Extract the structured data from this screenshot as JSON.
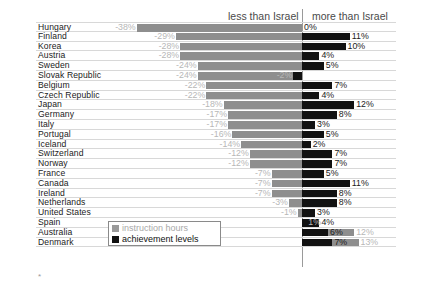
{
  "header": {
    "left_label": "less than Israel",
    "right_label": "more than Israel"
  },
  "legend": {
    "items": [
      {
        "label": "instruction hours",
        "color": "#9a9a9a",
        "swatch": "gray-square-icon"
      },
      {
        "label": "achievement levels",
        "color": "#111111",
        "swatch": "black-square-icon"
      }
    ]
  },
  "footnote": "*",
  "colors": {
    "instruction_hours": "#8e8e8e",
    "achievement_levels": "#121212",
    "negative_label": "#b7b7b7",
    "positive_label": "#1b1b1b",
    "gridline": "#d8d8d8",
    "axis": "#9a9a9a"
  },
  "chart_data": {
    "type": "bar",
    "title": "",
    "subtitle": "",
    "xlabel": "",
    "ylabel": "",
    "orientation": "horizontal",
    "grid": true,
    "legend_position": "bottom-left",
    "axis_labels": {
      "negative_side": "less than Israel",
      "positive_side": "more than Israel"
    },
    "zero_reference": "Israel",
    "xlim": [
      -40,
      16
    ],
    "categories": [
      "Hungary",
      "Finland",
      "Korea",
      "Austria",
      "Sweden",
      "Slovak Republic",
      "Belgium",
      "Czech Republic",
      "Japan",
      "Germany",
      "Italy",
      "Portugal",
      "Iceland",
      "Switzerland",
      "Norway",
      "France",
      "Canada",
      "Ireland",
      "Netherlands",
      "United States",
      "Spain",
      "Australia",
      "Denmark"
    ],
    "series": [
      {
        "name": "instruction hours",
        "color": "#8e8e8e",
        "values": [
          -38,
          -29,
          -28,
          -28,
          -24,
          -24,
          -22,
          -22,
          -18,
          -17,
          -17,
          -16,
          -14,
          -12,
          -12,
          -7,
          -7,
          -7,
          -3,
          -1,
          1,
          12,
          13
        ],
        "labels": [
          "-38%",
          "-29%",
          "-28%",
          "-28%",
          "-24%",
          "-24%",
          "-22%",
          "-22%",
          "-18%",
          "-17%",
          "-17%",
          "-16%",
          "-14%",
          "-12%",
          "-12%",
          "-7%",
          "-7%",
          "-7%",
          "-3%",
          "-1%",
          "1%",
          "12%",
          "13%"
        ]
      },
      {
        "name": "achievement levels",
        "color": "#121212",
        "values": [
          0,
          11,
          10,
          4,
          5,
          -2,
          7,
          4,
          12,
          8,
          3,
          5,
          2,
          7,
          7,
          5,
          11,
          8,
          8,
          3,
          4,
          6,
          7
        ],
        "labels": [
          "0%",
          "11%",
          "10%",
          "4%",
          "5%",
          "-2%",
          "7%",
          "4%",
          "12%",
          "8%",
          "3%",
          "5%",
          "2%",
          "7%",
          "7%",
          "5%",
          "11%",
          "8%",
          "8%",
          "3%",
          "4%",
          "6%",
          "7%"
        ]
      }
    ],
    "rows": [
      {
        "country": "Hungary",
        "hours": -38,
        "hours_label": "-38%",
        "achv": 0,
        "achv_label": "0%"
      },
      {
        "country": "Finland",
        "hours": -29,
        "hours_label": "-29%",
        "achv": 11,
        "achv_label": "11%"
      },
      {
        "country": "Korea",
        "hours": -28,
        "hours_label": "-28%",
        "achv": 10,
        "achv_label": "10%"
      },
      {
        "country": "Austria",
        "hours": -28,
        "hours_label": "-28%",
        "achv": 4,
        "achv_label": "4%"
      },
      {
        "country": "Sweden",
        "hours": -24,
        "hours_label": "-24%",
        "achv": 5,
        "achv_label": "5%"
      },
      {
        "country": "Slovak Republic",
        "hours": -24,
        "hours_label": "-24%",
        "achv": -2,
        "achv_label": "-2%"
      },
      {
        "country": "Belgium",
        "hours": -22,
        "hours_label": "-22%",
        "achv": 7,
        "achv_label": "7%"
      },
      {
        "country": "Czech Republic",
        "hours": -22,
        "hours_label": "-22%",
        "achv": 4,
        "achv_label": "4%"
      },
      {
        "country": "Japan",
        "hours": -18,
        "hours_label": "-18%",
        "achv": 12,
        "achv_label": "12%"
      },
      {
        "country": "Germany",
        "hours": -17,
        "hours_label": "-17%",
        "achv": 8,
        "achv_label": "8%"
      },
      {
        "country": "Italy",
        "hours": -17,
        "hours_label": "-17%",
        "achv": 3,
        "achv_label": "3%"
      },
      {
        "country": "Portugal",
        "hours": -16,
        "hours_label": "-16%",
        "achv": 5,
        "achv_label": "5%"
      },
      {
        "country": "Iceland",
        "hours": -14,
        "hours_label": "-14%",
        "achv": 2,
        "achv_label": "2%"
      },
      {
        "country": "Switzerland",
        "hours": -12,
        "hours_label": "-12%",
        "achv": 7,
        "achv_label": "7%"
      },
      {
        "country": "Norway",
        "hours": -12,
        "hours_label": "-12%",
        "achv": 7,
        "achv_label": "7%"
      },
      {
        "country": "France",
        "hours": -7,
        "hours_label": "-7%",
        "achv": 5,
        "achv_label": "5%"
      },
      {
        "country": "Canada",
        "hours": -7,
        "hours_label": "-7%",
        "achv": 11,
        "achv_label": "11%"
      },
      {
        "country": "Ireland",
        "hours": -7,
        "hours_label": "-7%",
        "achv": 8,
        "achv_label": "8%"
      },
      {
        "country": "Netherlands",
        "hours": -3,
        "hours_label": "-3%",
        "achv": 8,
        "achv_label": "8%"
      },
      {
        "country": "United States",
        "hours": -1,
        "hours_label": "-1%",
        "achv": 3,
        "achv_label": "3%"
      },
      {
        "country": "Spain",
        "hours": 1,
        "hours_label": "1%",
        "achv": 4,
        "achv_label": "4%"
      },
      {
        "country": "Australia",
        "hours": 12,
        "hours_label": "12%",
        "achv": 6,
        "achv_label": "6%"
      },
      {
        "country": "Denmark",
        "hours": 13,
        "hours_label": "13%",
        "achv": 7,
        "achv_label": "7%"
      }
    ]
  }
}
